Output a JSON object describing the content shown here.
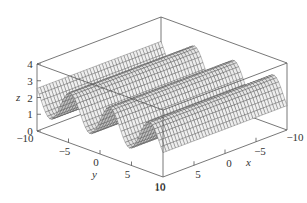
{
  "chart_data": {
    "type": "surface3d",
    "title": "",
    "function": "z = 2 + sin(y)",
    "xlabel": "x",
    "ylabel": "y",
    "zlabel": "z",
    "xlim": [
      -10,
      10
    ],
    "ylim": [
      -10,
      10
    ],
    "zlim": [
      0,
      4
    ],
    "x_ticks": [
      -10,
      -5,
      0,
      5,
      10
    ],
    "y_ticks": [
      -10,
      -5,
      0,
      5,
      10
    ],
    "z_ticks": [
      0,
      1,
      2,
      3,
      4
    ],
    "x_tick_labels": [
      "10",
      "5",
      "0",
      "−5",
      "−10"
    ],
    "y_tick_labels": [
      "−10",
      "−5",
      "0",
      "5",
      "10"
    ],
    "z_tick_labels": [
      "0",
      "1",
      "2",
      "3",
      "4"
    ],
    "grid": false,
    "box": true,
    "surface_color": "#d8d8d8",
    "edge_color": "#444444",
    "mesh": {
      "x_steps": 40,
      "y_steps": 60
    }
  },
  "labels": {
    "x": "x",
    "y": "y",
    "z": "z"
  }
}
